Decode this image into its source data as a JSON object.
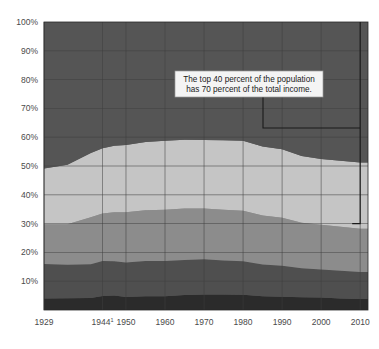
{
  "chart_data": {
    "type": "area",
    "title": "",
    "subtitle": "",
    "xlabel": "",
    "ylabel": "",
    "stacked": true,
    "normalized_percent": true,
    "grid": true,
    "legend_position": "none",
    "ylim": [
      0,
      100
    ],
    "ytick_labels": [
      "10%",
      "20%",
      "30%",
      "40%",
      "50%",
      "60%",
      "70%",
      "80%",
      "90%",
      "100%"
    ],
    "ytick_values": [
      10,
      20,
      30,
      40,
      50,
      60,
      70,
      80,
      90,
      100
    ],
    "xtick_labels": [
      "1929",
      "1944",
      "1950",
      "1960",
      "1970",
      "1980",
      "1990",
      "2000",
      "2010"
    ],
    "xtick_superscripts": [
      "",
      "1",
      "",
      "",
      "",
      "",
      "",
      "",
      ""
    ],
    "xtick_values": [
      1929,
      1944,
      1950,
      1960,
      1970,
      1980,
      1990,
      2000,
      2010
    ],
    "xlim": [
      1929,
      2012
    ],
    "x": [
      1929,
      1935,
      1941,
      1944,
      1947,
      1950,
      1955,
      1960,
      1965,
      1970,
      1975,
      1980,
      1985,
      1990,
      1995,
      2000,
      2005,
      2010,
      2012
    ],
    "series": [
      {
        "name": "Lowest fifth",
        "color": "#2b2b2b",
        "values": [
          4.0,
          4.1,
          4.2,
          4.9,
          5.0,
          4.5,
          4.8,
          4.8,
          5.2,
          5.4,
          5.4,
          5.3,
          4.8,
          4.6,
          4.4,
          4.3,
          4.0,
          3.8,
          3.8
        ]
      },
      {
        "name": "Second fifth",
        "color": "#4f4f4f",
        "values": [
          12.0,
          11.6,
          11.7,
          12.1,
          11.9,
          12.0,
          12.2,
          12.2,
          12.2,
          12.2,
          11.8,
          11.6,
          11.0,
          10.8,
          10.1,
          9.8,
          9.6,
          9.4,
          9.4
        ]
      },
      {
        "name": "Third fifth",
        "color": "#8c8c8c",
        "values": [
          13.8,
          14.1,
          16.3,
          16.5,
          17.0,
          17.4,
          17.6,
          17.8,
          17.8,
          17.6,
          17.6,
          17.6,
          17.0,
          16.6,
          15.8,
          15.5,
          15.3,
          15.0,
          15.0
        ]
      },
      {
        "name": "Fourth fifth",
        "color": "#c5c5c5",
        "values": [
          19.3,
          20.6,
          22.3,
          22.7,
          23.1,
          23.4,
          23.7,
          24.0,
          23.9,
          23.8,
          24.1,
          24.3,
          24.0,
          23.8,
          23.2,
          22.8,
          22.9,
          23.0,
          23.0
        ]
      },
      {
        "name": "Highest fifth",
        "color": "#555555",
        "values": [
          50.9,
          49.6,
          45.5,
          43.8,
          43.0,
          42.7,
          41.7,
          41.2,
          40.9,
          41.0,
          41.1,
          41.2,
          43.2,
          44.2,
          46.5,
          47.6,
          48.2,
          48.8,
          48.8
        ]
      }
    ],
    "annotation": {
      "line1": "The top 40 percent of the population",
      "line2": "has 70 percent of the total income.",
      "callout_bracket_top_percent": 100,
      "callout_bracket_bottom_percent": 30,
      "callout_bracket_x_year": 2010
    },
    "colors": {
      "plot_background": "#5a5a5a",
      "grid": "#3f3f3f",
      "axis_line": "#2a2a2a",
      "page_background": "#ffffff",
      "annotation_background": "#f4f4f4",
      "annotation_border": "#9a9a9a",
      "callout_line": "#1a1a1a",
      "tick_label": "#4a4a4a"
    }
  }
}
